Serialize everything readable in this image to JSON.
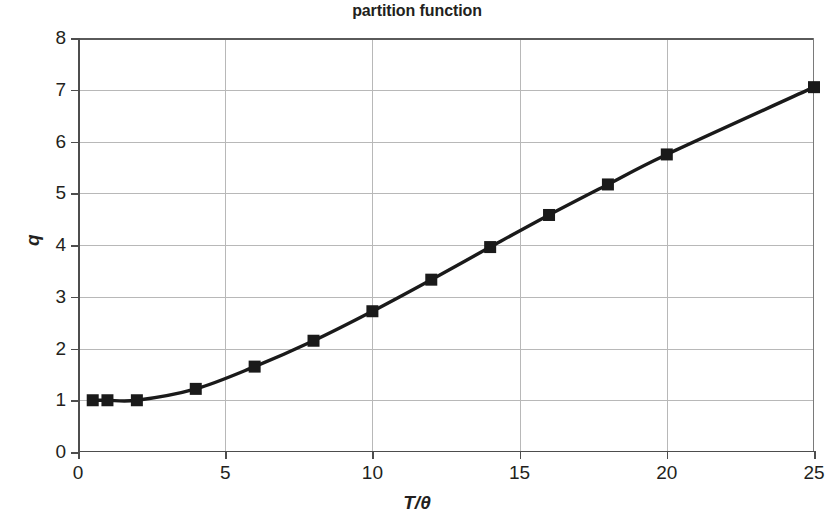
{
  "chart_data": {
    "type": "line",
    "title": "partition function",
    "xlabel": "T/θ",
    "ylabel": "q",
    "xlim": [
      0,
      25
    ],
    "ylim": [
      0,
      8
    ],
    "xticks": [
      0,
      5,
      10,
      15,
      20,
      25
    ],
    "yticks": [
      0,
      1,
      2,
      3,
      4,
      5,
      6,
      7,
      8
    ],
    "grid": true,
    "legend": "none",
    "marker": "square",
    "marker_color": "#1a1a1a",
    "line_color": "#1a1a1a",
    "x": [
      0.5,
      1,
      2,
      4,
      6,
      8,
      10,
      12,
      14,
      16,
      18,
      20,
      25
    ],
    "y": [
      1.0,
      1.0,
      1.0,
      1.22,
      1.65,
      2.15,
      2.72,
      3.33,
      3.96,
      4.58,
      5.17,
      5.75,
      7.05
    ],
    "series": [
      {
        "name": "q",
        "points": [
          {
            "x": 0.5,
            "y": 1.0
          },
          {
            "x": 1,
            "y": 1.0
          },
          {
            "x": 2,
            "y": 1.0
          },
          {
            "x": 4,
            "y": 1.22
          },
          {
            "x": 6,
            "y": 1.65
          },
          {
            "x": 8,
            "y": 2.15
          },
          {
            "x": 10,
            "y": 2.72
          },
          {
            "x": 12,
            "y": 3.33
          },
          {
            "x": 14,
            "y": 3.96
          },
          {
            "x": 16,
            "y": 4.58
          },
          {
            "x": 18,
            "y": 5.17
          },
          {
            "x": 20,
            "y": 5.75
          },
          {
            "x": 25,
            "y": 7.05
          }
        ]
      }
    ]
  },
  "axis": {
    "x_tick_labels": [
      "0",
      "5",
      "10",
      "15",
      "20",
      "25"
    ],
    "y_tick_labels": [
      "0",
      "1",
      "2",
      "3",
      "4",
      "5",
      "6",
      "7",
      "8"
    ],
    "x_title": "T/θ",
    "y_title": "q"
  },
  "colors": {
    "background": "#ffffff",
    "text": "#231f20",
    "grid": "#b8b8b8",
    "axis": "#4d4d4d",
    "data": "#1a1a1a"
  }
}
